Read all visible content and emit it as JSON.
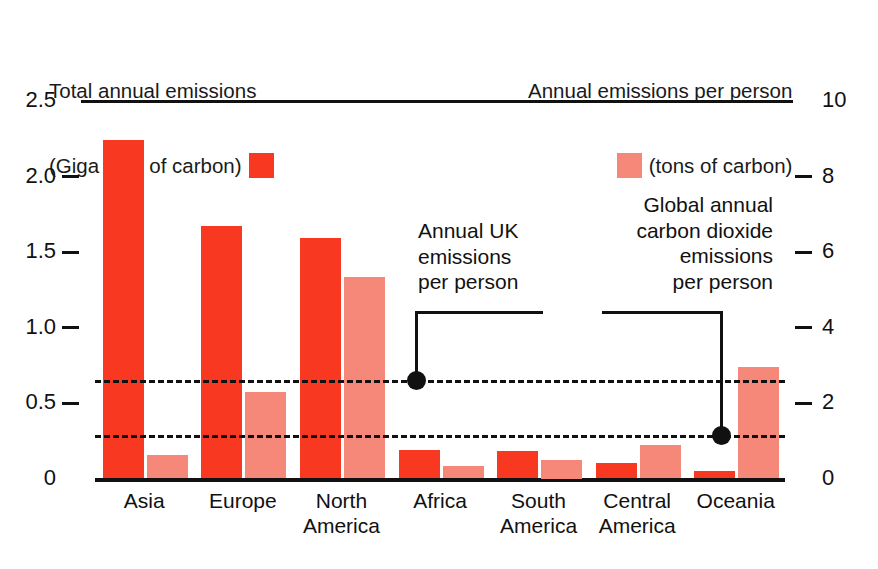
{
  "legend": {
    "left": {
      "line1": "Total annual emissions",
      "line2": "(Giga tons of carbon)",
      "swatch_color": "#f93822",
      "swatch_name": "total-annual-emissions-swatch"
    },
    "right": {
      "line1": "Annual emissions per person",
      "line2": "(tons of carbon)",
      "swatch_color": "#f58878",
      "swatch_name": "emissions-per-person-swatch"
    }
  },
  "annotations": {
    "uk": {
      "line1": "Annual UK",
      "line2": "emissions",
      "line3": "per person",
      "value_tons": 2.6
    },
    "global": {
      "line1": "Global annual",
      "line2": "carbon dioxide",
      "line3": "emissions",
      "line4": "per person",
      "value_tons": 1.15
    }
  },
  "chart_data": {
    "type": "bar",
    "title": "",
    "xlabel": "",
    "ylabel": "Total annual emissions (Giga tons of carbon)",
    "y2label": "Annual emissions per person (tons of carbon)",
    "categories": [
      "Asia",
      "Europe",
      "North\nAmerica",
      "Africa",
      "South\nAmerica",
      "Central\nAmerica",
      "Oceania"
    ],
    "ylim": [
      0,
      2.5
    ],
    "y2lim": [
      0,
      10
    ],
    "yticks": [
      "0",
      "0.5",
      "1.0",
      "1.5",
      "2.0",
      "2.5"
    ],
    "ytick_values": [
      0,
      0.5,
      1.0,
      1.5,
      2.0,
      2.5
    ],
    "y2ticks": [
      "0",
      "2",
      "4",
      "6",
      "8",
      "10"
    ],
    "y2tick_values": [
      0,
      2,
      4,
      6,
      8,
      10
    ],
    "grid": false,
    "legend_position": "top",
    "series": [
      {
        "name": "Total annual emissions (Giga tons of carbon)",
        "axis": "left",
        "color": "#f93822",
        "values": [
          2.24,
          1.67,
          1.59,
          0.19,
          0.18,
          0.1,
          0.05
        ]
      },
      {
        "name": "Annual emissions per person (tons of carbon)",
        "axis": "right",
        "color": "#f58878",
        "values": [
          0.62,
          2.28,
          5.35,
          0.34,
          0.5,
          0.88,
          2.95
        ]
      }
    ],
    "reference_lines": [
      {
        "label": "Annual UK emissions per person",
        "value_tons": 2.6,
        "axis": "right",
        "style": "dashed"
      },
      {
        "label": "Global annual carbon dioxide emissions per person",
        "value_tons": 1.15,
        "axis": "right",
        "style": "dashed"
      }
    ]
  }
}
